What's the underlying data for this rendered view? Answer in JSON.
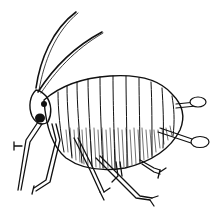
{
  "illustration": {
    "subject": "aphid",
    "style": "black-and-white line drawing",
    "colors": {
      "background": "#ffffff",
      "ink": "#111111"
    },
    "parts": [
      "antennae",
      "head",
      "eye",
      "abdomen",
      "cornicles",
      "legs"
    ]
  }
}
